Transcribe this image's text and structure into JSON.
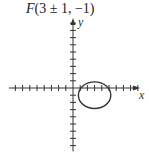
{
  "title": {
    "prefix": "F",
    "rest": "(3 ± 1, −1)"
  },
  "axes": {
    "x_label": "x",
    "y_label": "y",
    "x_ticks_negative": 8,
    "x_ticks_positive": 9,
    "y_ticks_positive": 9,
    "y_ticks_negative": 8
  },
  "ellipse": {
    "center": [
      3,
      -1
    ],
    "foci": [
      [
        2,
        -1
      ],
      [
        4,
        -1
      ]
    ],
    "semi_major": 2.25,
    "semi_minor": 1.85
  },
  "colors": {
    "stroke": "#333333"
  }
}
